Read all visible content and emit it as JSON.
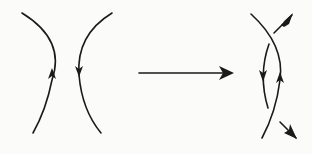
{
  "diagram": {
    "colors": {
      "ink": "#1a1a1a",
      "background": "#fbfbf9"
    },
    "left_panel": {
      "curves": [
        {
          "id": "left-arc",
          "bulge": "right",
          "arrow_direction": "up"
        },
        {
          "id": "right-arc",
          "bulge": "left",
          "arrow_direction": "down"
        }
      ]
    },
    "transition_arrow": {
      "direction": "right"
    },
    "right_panel": {
      "curves": [
        {
          "id": "inner-arc",
          "arrow_direction": "down"
        },
        {
          "id": "outer-arc",
          "arrow_direction": "up"
        }
      ],
      "outgoing_arrows": [
        {
          "id": "top-right-arrow",
          "direction": "down-left"
        },
        {
          "id": "bottom-right-arrow",
          "direction": "down-right"
        }
      ]
    }
  }
}
